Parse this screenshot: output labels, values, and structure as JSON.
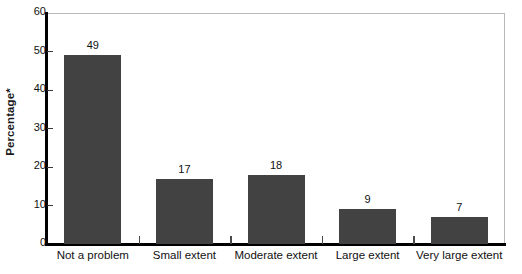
{
  "chart_data": {
    "type": "bar",
    "title": "",
    "xlabel": "",
    "ylabel": "Percentage*",
    "categories": [
      "Not a problem",
      "Small extent",
      "Moderate extent",
      "Large extent",
      "Very large extent"
    ],
    "values": [
      49,
      17,
      18,
      9,
      7
    ],
    "value_labels": [
      "49",
      "17",
      "18",
      "9",
      "7"
    ],
    "ylim": [
      0,
      60
    ],
    "yticks": [
      0,
      10,
      20,
      30,
      40,
      50,
      60
    ],
    "ytick_labels": [
      "0",
      "10",
      "20",
      "30",
      "40",
      "50",
      "60"
    ],
    "grid": false,
    "legend": "none",
    "bar_color": "#424242",
    "axis_color": "#000000",
    "frame_color": "#b9b9b9",
    "background": "#ffffff"
  }
}
